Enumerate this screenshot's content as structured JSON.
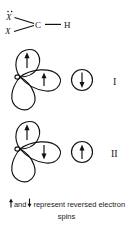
{
  "figure": {
    "title_present": false,
    "background_color": "#ffffff",
    "ink_color": "#111111"
  },
  "formula": {
    "atoms": [
      {
        "id": "x-top",
        "label": "X",
        "has_lone_pair_dots": true,
        "dot_count": 2
      },
      {
        "id": "x-bottom",
        "label": "X",
        "has_lone_pair_dots": false,
        "dot_count": 0
      },
      {
        "id": "carbon",
        "label": "C"
      },
      {
        "id": "hydrogen",
        "label": "H"
      }
    ],
    "bonds": [
      {
        "from": "x-top",
        "to": "carbon",
        "order": 1
      },
      {
        "from": "x-bottom",
        "to": "carbon",
        "order": 1
      },
      {
        "from": "carbon",
        "to": "hydrogen",
        "order": 1
      }
    ]
  },
  "diagrams": [
    {
      "id": "diagram-1",
      "roman_label": "I",
      "lobes": [
        {
          "id": "lobe-top",
          "position": "top",
          "spin": "up",
          "arrow": "↑"
        },
        {
          "id": "lobe-right",
          "position": "right",
          "spin": "up",
          "arrow": "↑"
        },
        {
          "id": "lobe-bottom",
          "position": "bottom",
          "spin": "none",
          "arrow": ""
        }
      ],
      "spin_circle": {
        "id": "spin-circle-1",
        "spin": "down",
        "arrow": "↓"
      }
    },
    {
      "id": "diagram-2",
      "roman_label": "II",
      "lobes": [
        {
          "id": "lobe-top",
          "position": "top",
          "spin": "up",
          "arrow": "↑"
        },
        {
          "id": "lobe-right",
          "position": "right",
          "spin": "down",
          "arrow": "↓"
        },
        {
          "id": "lobe-bottom",
          "position": "bottom",
          "spin": "none",
          "arrow": ""
        }
      ],
      "spin_circle": {
        "id": "spin-circle-2",
        "spin": "up",
        "arrow": "↑"
      }
    }
  ],
  "caption": {
    "arrow_up": "↑",
    "mid_text": "and",
    "arrow_down": "↓",
    "text_after": "represent reversed electron",
    "line2": "spins"
  }
}
